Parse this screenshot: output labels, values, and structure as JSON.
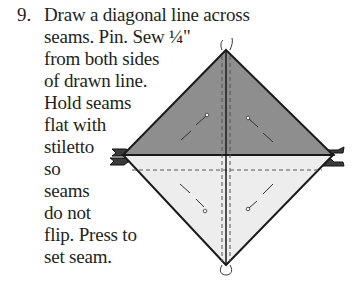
{
  "instruction": {
    "step_number": "9.",
    "lines": [
      "Draw a diagonal line across",
      "seams. Pin. Sew ¼\"",
      "from both sides",
      "of drawn line.",
      "Hold seams",
      "flat with",
      "stiletto",
      "so",
      "seams",
      "do not",
      "flip. Press to",
      "set seam."
    ]
  },
  "diagram": {
    "colors": {
      "top_triangle": "#8e8e8e",
      "bottom_triangle": "#ededed",
      "outline": "#1a1a1a",
      "tab": "#3a3a3a"
    }
  }
}
